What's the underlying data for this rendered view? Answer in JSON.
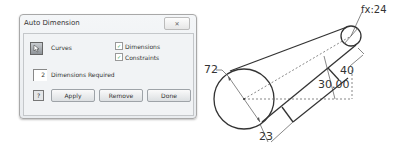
{
  "dialog": {
    "title": "Auto Dimension",
    "close_icon": "close-x-icon",
    "curves_label": "Curves",
    "curves_icon": "cursor-arrow-icon",
    "checkboxes": [
      {
        "label": "Dimensions",
        "checked": true
      },
      {
        "label": "Constraints",
        "checked": true
      }
    ],
    "required_count": "2",
    "required_label": "Dimensions Required",
    "help_icon": "help-icon",
    "buttons": {
      "apply": "Apply",
      "remove": "Remove",
      "done": "Done"
    }
  },
  "drawing": {
    "labels": {
      "fx": "fx:24",
      "big_diameter": "72",
      "length": "40",
      "offset": "30.00",
      "bottom": "23"
    },
    "colors": {
      "stroke": "#333333",
      "dim_line": "#555555"
    }
  }
}
